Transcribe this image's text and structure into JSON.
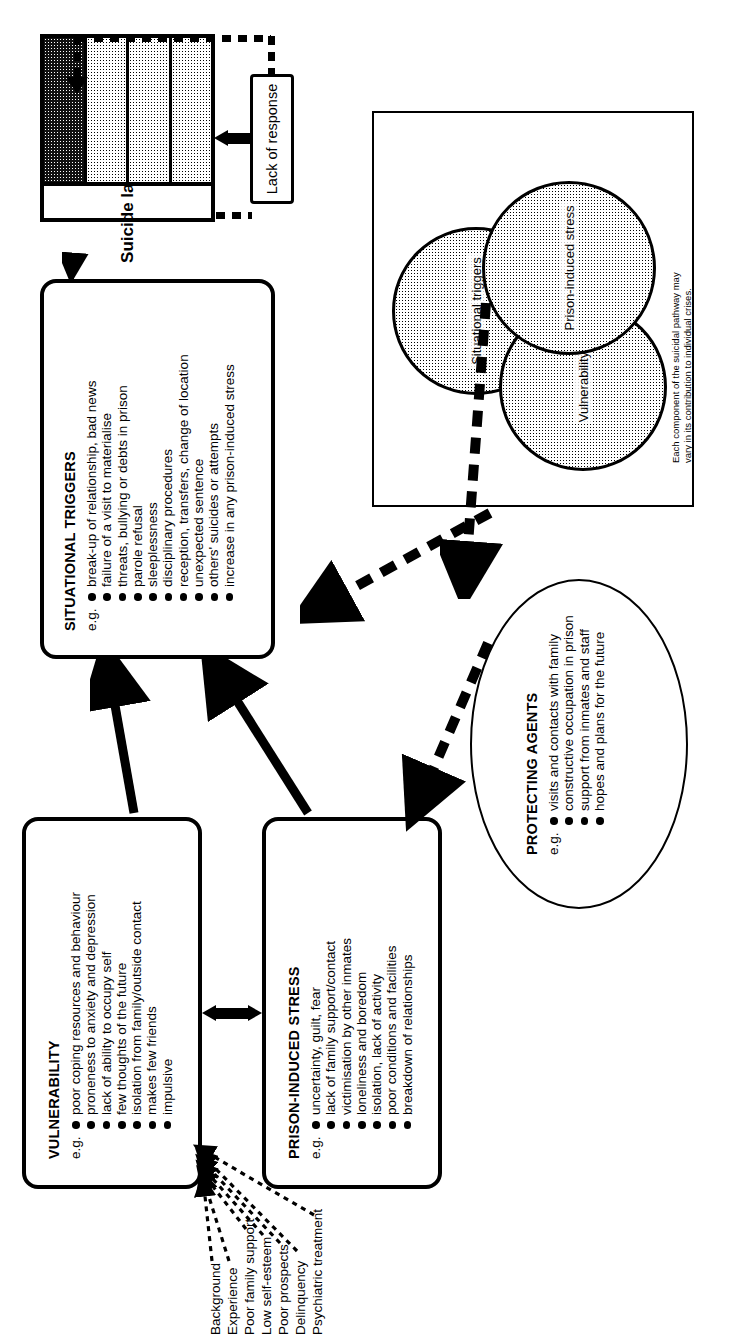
{
  "figure": {
    "caption": "Fig. 6.1   Diagrammatic representation of the young prisoner's pathway to suicide"
  },
  "ladder": {
    "title": "Suicide ladder",
    "title_superscript": "1",
    "axis_labels": [
      "communication",
      "escape"
    ],
    "rung_labels": [
      "distress",
      "despair"
    ],
    "rungs": [
      "rung-1-lightest",
      "rung-2-light",
      "rung-3-mid",
      "rung-4-darkest"
    ]
  },
  "lack_of_response": {
    "label": "Lack of response"
  },
  "situational_triggers": {
    "title": "SITUATIONAL TRIGGERS",
    "eg": "e.g.",
    "items": [
      "break-up of relationship, bad news",
      "failure of a visit to materialise",
      "threats, bullying or debts in prison",
      "parole refusal",
      "sleeplessness",
      "disciplinary procedures",
      "reception, transfers, change of location",
      "unexpected sentence",
      "others' suicides or attempts",
      "increase in any prison-induced stress"
    ]
  },
  "vulnerability": {
    "title": "VULNERABILITY",
    "eg": "e.g.",
    "items": [
      "poor coping resources and behaviour",
      "proneness to anxiety and depression",
      "lack of ability to occupy self",
      "few thoughts of the future",
      "isolation from family/outside contact",
      "makes few friends",
      "impulsive"
    ]
  },
  "prison_induced_stress": {
    "title": "PRISON-INDUCED STRESS",
    "eg": "e.g.",
    "items": [
      "uncertainty, guilt, fear",
      "lack of family support/contact",
      "victimisation by other inmates",
      "loneliness and boredom",
      "isolation, lack of activity",
      "poor conditions and facilities",
      "breakdown of relationships"
    ]
  },
  "protecting_agents": {
    "title": "PROTECTING AGENTS",
    "eg": "e.g.",
    "items": [
      "visits and contacts with family",
      "constructive occupation in prison",
      "support from inmates and staff",
      "hopes and plans for the future"
    ]
  },
  "background_factors": {
    "items": [
      "Background",
      "Experience",
      "Poor family support",
      "Low self-esteem",
      "Poor prospects",
      "Delinquency",
      "Psychiatric treatment"
    ]
  },
  "venn": {
    "circles": [
      {
        "label": "Situational triggers"
      },
      {
        "label": "Prison-induced stress"
      },
      {
        "label": "Vulnerability"
      }
    ],
    "note_line_1": "Each component of the suicidal pathway may",
    "note_line_2": "vary in its contribution to individual crises."
  }
}
